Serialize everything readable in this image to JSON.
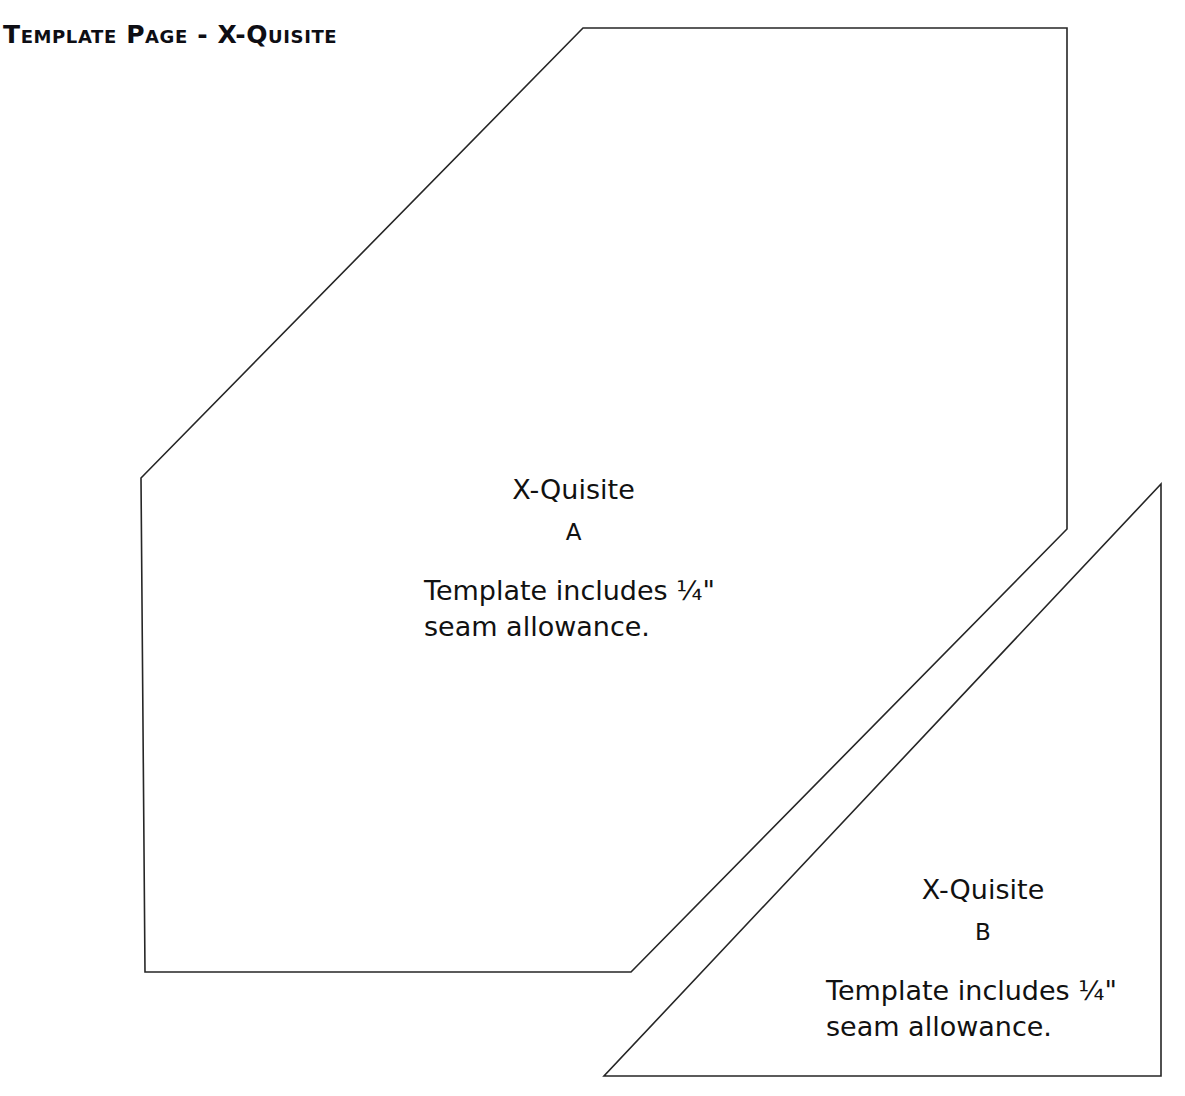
{
  "page": {
    "title": "Template Page - X-Quisite",
    "background_color": "#ffffff",
    "ink_color": "#262626",
    "width": 1185,
    "height": 1096
  },
  "pieces": [
    {
      "id": "piece-a",
      "name": "X-Quisite",
      "letter": "A",
      "note_line1": "Template includes ¼\"",
      "note_line2": "seam allowance.",
      "outline": "141,478 583,28 1067,28 1067,529 631,972 145,972",
      "shape_kind": "hexagon"
    },
    {
      "id": "piece-b",
      "name": "X-Quisite",
      "letter": "B",
      "note_line1": "Template includes ¼\"",
      "note_line2": "seam allowance.",
      "outline": "1161,484 1161,1076 604,1076",
      "shape_kind": "right-triangle"
    }
  ]
}
